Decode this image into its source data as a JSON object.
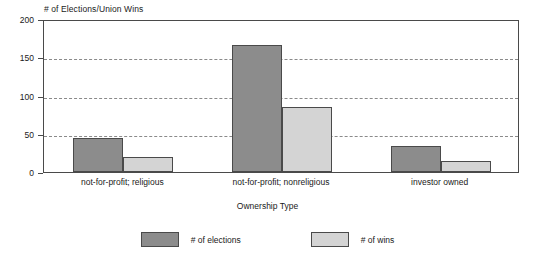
{
  "chart_data": {
    "type": "bar",
    "title": "",
    "ylabel": "# of Elections/Union Wins",
    "xlabel": "Ownership Type",
    "categories": [
      "not-for-profit; religious",
      "not-for-profit; nonreligious",
      "investor owned"
    ],
    "series": [
      {
        "name": "# of elections",
        "color": "#8c8c8c",
        "values": [
          44,
          166,
          34
        ]
      },
      {
        "name": "# of wins",
        "color": "#d4d4d4",
        "values": [
          19,
          85,
          14
        ]
      }
    ],
    "ylim": [
      0,
      200
    ],
    "yticks": [
      0,
      50,
      100,
      150,
      200
    ],
    "ytick_labels": [
      "0",
      "50",
      "100",
      "150",
      "200"
    ],
    "grid": "horizontal-dashed",
    "legend_position": "bottom-center",
    "frame": "box",
    "background": "#ffffff",
    "axis_color": "#4a4a4a",
    "grid_color": "#8a8a8a"
  }
}
